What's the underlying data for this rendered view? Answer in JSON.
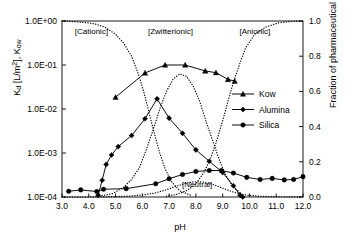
{
  "chart_data": {
    "type": "line",
    "title": "",
    "xlabel": "pH",
    "ylabel_left": "Kd [L/m2], Kow",
    "ylabel_right": "Fraction of pharmaceutical",
    "xlim": [
      3.0,
      12.0
    ],
    "xticks": [
      "3.0",
      "4.0",
      "5.0",
      "6.0",
      "7.0",
      "8.0",
      "9.0",
      "10.0",
      "11.0",
      "12.0"
    ],
    "xtick_values": [
      3.0,
      4.0,
      5.0,
      6.0,
      7.0,
      8.0,
      9.0,
      10.0,
      11.0,
      12.0
    ],
    "ylim_left_log": [
      0.0001,
      1.0
    ],
    "yticks_left": [
      "1.0E+00",
      "1.0E-01",
      "1.0E-02",
      "1.0E-03",
      "1.0E-04"
    ],
    "ytick_left_values": [
      1.0,
      0.1,
      0.01,
      0.001,
      0.0001
    ],
    "ylim_right": [
      0.0,
      1.0
    ],
    "yticks_right": [
      "1.0",
      "0.8",
      "0.6",
      "0.4",
      "0.2",
      "0.0"
    ],
    "ytick_right_values": [
      1.0,
      0.8,
      0.6,
      0.4,
      0.2,
      0.0
    ],
    "grid": false,
    "legend_position": "right-middle",
    "legend": [
      {
        "name": "Kow",
        "marker": "triangle",
        "line": "solid"
      },
      {
        "name": "Alumina",
        "marker": "diamond",
        "line": "solid"
      },
      {
        "name": "Silica",
        "marker": "circle",
        "line": "solid"
      }
    ],
    "annotations": [
      {
        "text": "[Cationic]",
        "x": 4.1,
        "y_frac": 0.945
      },
      {
        "text": "[Zwitterionic]",
        "x": 7.05,
        "y_frac": 0.945
      },
      {
        "text": "[Anionic]",
        "x": 10.2,
        "y_frac": 0.945
      },
      {
        "text": "[Neutral]",
        "x": 8.05,
        "y_frac": 0.075
      }
    ],
    "series": [
      {
        "name": "Kow",
        "axis": "left",
        "marker": "triangle",
        "line": "solid",
        "x": [
          5.0,
          6.1,
          6.85,
          7.6,
          8.35,
          8.75,
          9.2,
          9.45
        ],
        "y": [
          0.0185,
          0.066,
          0.1,
          0.1,
          0.073,
          0.067,
          0.047,
          0.043
        ]
      },
      {
        "name": "Alumina",
        "axis": "left",
        "marker": "diamond",
        "line": "solid",
        "x": [
          4.35,
          4.5,
          4.65,
          4.85,
          5.1,
          5.6,
          6.1,
          6.55,
          7.0,
          7.5,
          8.0,
          8.5,
          9.0,
          9.4,
          9.65,
          9.75
        ],
        "y": [
          0.00011,
          0.00024,
          0.00055,
          0.0009,
          0.0014,
          0.0025,
          0.006,
          0.017,
          0.0062,
          0.0028,
          0.00118,
          0.00065,
          0.00036,
          0.00018,
          0.00011,
          0.0001
        ]
      },
      {
        "name": "Silica",
        "axis": "left",
        "marker": "circle",
        "line": "solid",
        "x": [
          3.25,
          3.7,
          4.3,
          4.55,
          5.4,
          6.5,
          7.0,
          7.5,
          8.0,
          8.5,
          8.95,
          9.4,
          9.9,
          10.4,
          10.85,
          11.3,
          11.65,
          12.0
        ],
        "y": [
          0.000135,
          0.000145,
          0.000133,
          0.00015,
          0.000155,
          0.0002,
          0.00026,
          0.000325,
          0.00038,
          0.0004,
          0.0004,
          0.00035,
          0.00028,
          0.00025,
          0.000265,
          0.000245,
          0.00025,
          0.00029
        ]
      },
      {
        "name": "Cationic fraction",
        "axis": "right",
        "marker": "dot",
        "line": "dotted",
        "x": [
          3.0,
          3.6,
          4.2,
          4.6,
          5.0,
          5.3,
          5.6,
          5.85,
          6.05,
          6.25,
          6.45,
          6.65,
          6.85,
          7.1,
          7.4,
          7.8
        ],
        "y": [
          1.0,
          0.995,
          0.985,
          0.965,
          0.925,
          0.875,
          0.8,
          0.7,
          0.6,
          0.48,
          0.36,
          0.25,
          0.16,
          0.085,
          0.035,
          0.01
        ]
      },
      {
        "name": "Zwitterionic fraction",
        "axis": "right",
        "marker": "dot",
        "line": "dotted",
        "x": [
          4.4,
          4.9,
          5.3,
          5.6,
          5.9,
          6.15,
          6.4,
          6.65,
          6.9,
          7.15,
          7.4,
          7.65,
          7.9,
          8.15,
          8.4,
          8.65,
          8.9,
          9.15,
          9.4,
          9.7
        ],
        "y": [
          0.005,
          0.02,
          0.055,
          0.1,
          0.17,
          0.27,
          0.38,
          0.5,
          0.6,
          0.67,
          0.7,
          0.685,
          0.63,
          0.54,
          0.42,
          0.31,
          0.2,
          0.115,
          0.055,
          0.02
        ]
      },
      {
        "name": "Anionic fraction",
        "axis": "right",
        "marker": "dot",
        "line": "dotted",
        "x": [
          6.9,
          7.3,
          7.7,
          8.0,
          8.3,
          8.55,
          8.8,
          9.05,
          9.3,
          9.55,
          9.85,
          10.2,
          10.6,
          11.1,
          11.6,
          12.0
        ],
        "y": [
          0.005,
          0.015,
          0.04,
          0.075,
          0.14,
          0.22,
          0.33,
          0.46,
          0.6,
          0.72,
          0.845,
          0.925,
          0.965,
          0.99,
          0.998,
          1.0
        ]
      },
      {
        "name": "Neutral fraction",
        "axis": "right",
        "marker": "dot",
        "line": "dotted",
        "x": [
          3.0,
          4.0,
          5.0,
          5.6,
          6.1,
          6.5,
          6.9,
          7.25,
          7.6,
          7.9,
          8.2,
          8.5,
          8.8,
          9.1,
          9.4,
          9.8,
          10.4,
          11.2,
          12.0
        ],
        "y": [
          0.0,
          0.0,
          0.002,
          0.006,
          0.013,
          0.024,
          0.041,
          0.06,
          0.077,
          0.086,
          0.086,
          0.078,
          0.062,
          0.044,
          0.028,
          0.013,
          0.004,
          0.001,
          0.0
        ]
      }
    ]
  },
  "colors": {
    "axis": "#000000",
    "series": "#000000",
    "background": "#ffffff"
  }
}
